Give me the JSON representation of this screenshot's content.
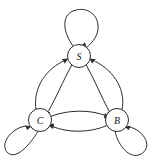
{
  "diagram": {
    "type": "directed-graph",
    "width": 157,
    "height": 162,
    "background_color": "#ffffff",
    "stroke_color": "#2b2b2b",
    "node_fill_color": "#ffffff",
    "label_color": "#1a1a1a",
    "nodes": [
      {
        "id": "S",
        "label": "S",
        "cx": 79,
        "cy": 56,
        "r": 11.5
      },
      {
        "id": "C",
        "label": "C",
        "cx": 40,
        "cy": 120,
        "r": 11.5
      },
      {
        "id": "B",
        "label": "B",
        "cx": 117,
        "cy": 120,
        "r": 11.5
      }
    ],
    "edges": [
      {
        "id": "S-S",
        "from": "S",
        "to": "S",
        "kind": "self-loop",
        "direction": "up"
      },
      {
        "id": "C-C",
        "from": "C",
        "to": "C",
        "kind": "self-loop",
        "direction": "down-left"
      },
      {
        "id": "B-B",
        "from": "B",
        "to": "B",
        "kind": "self-loop",
        "direction": "down-right"
      },
      {
        "id": "C-S",
        "from": "C",
        "to": "S",
        "kind": "curved",
        "direction": "up-right"
      },
      {
        "id": "S-C",
        "from": "S",
        "to": "C",
        "kind": "curved",
        "direction": "down-left"
      },
      {
        "id": "B-S",
        "from": "B",
        "to": "S",
        "kind": "curved",
        "direction": "up-left"
      },
      {
        "id": "S-B",
        "from": "S",
        "to": "B",
        "kind": "curved",
        "direction": "down-right"
      },
      {
        "id": "C-B",
        "from": "C",
        "to": "B",
        "kind": "curved",
        "direction": "right"
      },
      {
        "id": "B-C",
        "from": "B",
        "to": "C",
        "kind": "curved",
        "direction": "left"
      }
    ]
  }
}
